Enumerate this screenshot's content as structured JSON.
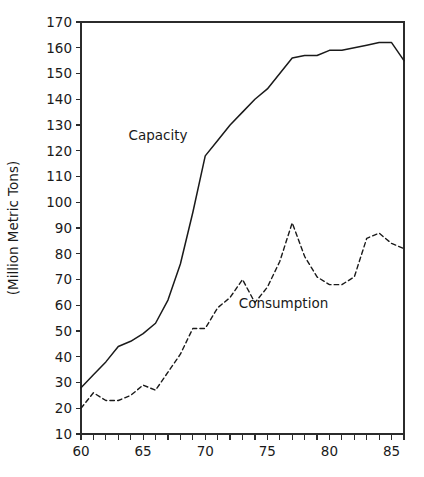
{
  "chart_data": {
    "type": "line",
    "title": "",
    "subtitle": "",
    "xlabel": "",
    "ylabel": "(Million Metric Tons)",
    "xlim": [
      60,
      86
    ],
    "ylim": [
      10,
      170
    ],
    "x_tick_step_major": 5,
    "x_tick_step_minor": 1,
    "y_tick_step": 10,
    "grid": false,
    "legend_position": "inline-annotations",
    "x_tick_labels": [
      "60",
      "65",
      "70",
      "75",
      "80",
      "85"
    ],
    "x_tick_values": [
      60,
      65,
      70,
      75,
      80,
      85
    ],
    "y_tick_labels": [
      "10",
      "20",
      "30",
      "40",
      "50",
      "60",
      "70",
      "80",
      "90",
      "100",
      "110",
      "120",
      "130",
      "140",
      "150",
      "160",
      "170"
    ],
    "y_tick_values": [
      10,
      20,
      30,
      40,
      50,
      60,
      70,
      80,
      90,
      100,
      110,
      120,
      130,
      140,
      150,
      160,
      170
    ],
    "x": [
      60,
      61,
      62,
      63,
      64,
      65,
      66,
      67,
      68,
      69,
      70,
      71,
      72,
      73,
      74,
      75,
      76,
      77,
      78,
      79,
      80,
      81,
      82,
      83,
      84,
      85,
      86
    ],
    "series": [
      {
        "name": "Capacity",
        "style": "solid",
        "color": "#1a1a1a",
        "label_x": 66.2,
        "label_y": 124,
        "values": [
          28,
          33,
          38,
          44,
          46,
          49,
          53,
          62,
          76,
          96,
          118,
          124,
          130,
          135,
          140,
          144,
          150,
          156,
          157,
          157,
          159,
          159,
          160,
          161,
          162,
          162,
          155
        ]
      },
      {
        "name": "Consumption",
        "style": "dashed",
        "color": "#1a1a1a",
        "label_x": 76.3,
        "label_y": 59,
        "values": [
          20,
          26,
          23,
          23,
          25,
          29,
          27,
          34,
          41,
          51,
          51,
          59,
          63,
          70,
          61,
          67,
          77,
          92,
          79,
          71,
          68,
          68,
          71,
          86,
          88,
          84,
          82
        ]
      }
    ],
    "annotations": [
      {
        "text": "Capacity",
        "x": 66.2,
        "y": 124
      },
      {
        "text": "Consumption",
        "x": 76.3,
        "y": 59
      }
    ]
  }
}
